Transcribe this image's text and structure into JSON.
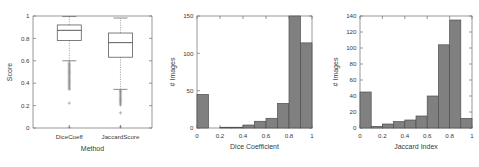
{
  "figure": {
    "title": "",
    "background": "#ffffff",
    "bar_fill_color": "#808080",
    "bar_edge_color": "#4f4f4f",
    "axis_color": "#6e6e6e"
  },
  "chart_data": [
    {
      "type": "box",
      "title": "",
      "xlabel": "Method",
      "ylabel": "Score",
      "categories": [
        "DiceCoeff",
        "JaccardScore"
      ],
      "ylim": [
        0,
        1
      ],
      "yticks": [
        0,
        0.2,
        0.4,
        0.6,
        0.8,
        1
      ],
      "ytick_labels": [
        "0",
        "0.2",
        "0.4",
        "0.6",
        "0.8",
        "1"
      ],
      "grid": false,
      "legend": "none",
      "boxes": [
        {
          "name": "DiceCoeff",
          "whisker_low": 0.6,
          "q1": 0.782,
          "median": 0.872,
          "q3": 0.92,
          "whisker_high": 0.995,
          "outliers": [
            0.59,
            0.575,
            0.565,
            0.555,
            0.545,
            0.535,
            0.525,
            0.515,
            0.505,
            0.495,
            0.485,
            0.475,
            0.465,
            0.455,
            0.445,
            0.435,
            0.425,
            0.415,
            0.405,
            0.395,
            0.385,
            0.375,
            0.365,
            0.355,
            0.345,
            0.222,
            0.005
          ]
        },
        {
          "name": "JaccardScore",
          "whisker_low": 0.345,
          "q1": 0.632,
          "median": 0.762,
          "q3": 0.848,
          "whisker_high": 0.982,
          "outliers": [
            0.335,
            0.325,
            0.315,
            0.305,
            0.295,
            0.285,
            0.275,
            0.265,
            0.255,
            0.245,
            0.235,
            0.225,
            0.215,
            0.205,
            0.135,
            0.01
          ]
        }
      ]
    },
    {
      "type": "bar",
      "subtype": "histogram",
      "title": "",
      "xlabel": "Dice Coefficient",
      "ylabel": "# Images",
      "xlim": [
        0,
        1
      ],
      "ylim": [
        0,
        150
      ],
      "xticks": [
        0,
        0.2,
        0.4,
        0.6,
        0.8,
        1
      ],
      "xtick_labels": [
        "0",
        "0.2",
        "0.4",
        "0.6",
        "0.8",
        "1"
      ],
      "yticks": [
        0,
        50,
        100,
        150
      ],
      "ytick_labels": [
        "0",
        "50",
        "100",
        "150"
      ],
      "grid": false,
      "legend": "none",
      "bin_edges": [
        0,
        0.1,
        0.2,
        0.3,
        0.4,
        0.5,
        0.6,
        0.7,
        0.8,
        0.9,
        1.0
      ],
      "bin_centers": [
        0.05,
        0.15,
        0.25,
        0.35,
        0.45,
        0.55,
        0.65,
        0.75,
        0.85,
        0.95
      ],
      "values": [
        45,
        0,
        1,
        1,
        4,
        9,
        13,
        33,
        150,
        114
      ]
    },
    {
      "type": "bar",
      "subtype": "histogram",
      "title": "",
      "xlabel": "Jaccard Index",
      "ylabel": "# Images",
      "xlim": [
        0,
        1
      ],
      "ylim": [
        0,
        140
      ],
      "xticks": [
        0,
        0.2,
        0.4,
        0.6,
        0.8,
        1
      ],
      "xtick_labels": [
        "0",
        "0.2",
        "0.4",
        "0.6",
        "0.8",
        "1"
      ],
      "yticks": [
        0,
        20,
        40,
        60,
        80,
        100,
        120,
        140
      ],
      "ytick_labels": [
        "0",
        "20",
        "40",
        "60",
        "80",
        "100",
        "120",
        "140"
      ],
      "grid": false,
      "legend": "none",
      "bin_edges": [
        0,
        0.1,
        0.2,
        0.3,
        0.4,
        0.5,
        0.6,
        0.7,
        0.8,
        0.9,
        1.0
      ],
      "bin_centers": [
        0.05,
        0.15,
        0.25,
        0.35,
        0.45,
        0.55,
        0.65,
        0.75,
        0.85,
        0.95
      ],
      "values": [
        45,
        2,
        5,
        8,
        10,
        15,
        40,
        104,
        135,
        12
      ]
    }
  ]
}
